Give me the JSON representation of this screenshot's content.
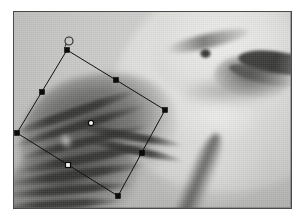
{
  "window": {
    "title": "Image with rotated rectangular selection",
    "background_color": "#ffffff"
  },
  "photo": {
    "name": "scanned grayscale painting of a bird",
    "subject": "bird (shrike / kingfisher style) facing right",
    "border_color": "#4a4a4a",
    "base_color": "#bcbcba",
    "frame": {
      "x": 13,
      "y": 11,
      "width": 279,
      "height": 198
    },
    "parts": [
      {
        "name": "head",
        "tone": "light"
      },
      {
        "name": "eye",
        "tone": "dark"
      },
      {
        "name": "brow-stripe",
        "tone": "mid-dark"
      },
      {
        "name": "beak",
        "tone": "dark"
      },
      {
        "name": "throat",
        "tone": "light"
      },
      {
        "name": "breast",
        "tone": "light"
      },
      {
        "name": "wing",
        "tone": "dark"
      },
      {
        "name": "feather-streaks",
        "tone": "dark"
      },
      {
        "name": "tail",
        "tone": "mid-dark"
      }
    ]
  },
  "selection": {
    "shape": "rotated-rectangle",
    "rotation_degrees": -31,
    "stroke_color": "#111111",
    "handle_color": "#0c0c0c",
    "handle_open_color": "#f4f4f4",
    "corners": [
      {
        "name": "top",
        "x": 67,
        "y": 50
      },
      {
        "name": "right",
        "x": 165,
        "y": 110
      },
      {
        "name": "bottom",
        "x": 118,
        "y": 196
      },
      {
        "name": "left",
        "x": 17,
        "y": 133
      }
    ],
    "midpoints": [
      {
        "name": "top-right-edge",
        "x": 116,
        "y": 80
      },
      {
        "name": "right-bottom-edge",
        "x": 142,
        "y": 153
      },
      {
        "name": "bottom-left-edge",
        "x": 68,
        "y": 165
      },
      {
        "name": "left-top-edge",
        "x": 42,
        "y": 92
      }
    ],
    "center_handle": {
      "name": "center-pivot",
      "x": 91,
      "y": 123,
      "style": "open-circle"
    },
    "rotation_handle": {
      "name": "rotation-grip",
      "x": 69,
      "y": 41,
      "radius": 4
    },
    "handle_size": 5
  }
}
